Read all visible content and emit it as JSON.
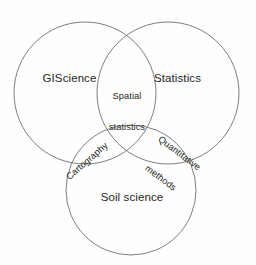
{
  "figure": {
    "type": "venn-diagram",
    "set_count": 3,
    "background_color": "#fefefe",
    "stroke_color": "#6e6e6e",
    "text_color": "#262626"
  },
  "chart_data": {
    "type": "venn",
    "title": "",
    "sets": [
      {
        "id": "giscience",
        "label": "GIScience",
        "cx": 85,
        "cy": 93,
        "r": 71
      },
      {
        "id": "statistics",
        "label": "Statistics",
        "cx": 168,
        "cy": 93,
        "r": 71
      },
      {
        "id": "soil_science",
        "label": "Soil science",
        "cx": 131,
        "cy": 190,
        "r": 65
      }
    ],
    "intersections": [
      {
        "id": "spatial_statistics",
        "label": "Spatial\nstatistics",
        "line1": "Spatial",
        "line2": "statistics",
        "members": [
          "giscience",
          "statistics"
        ],
        "rotation_deg": 0
      },
      {
        "id": "cartography",
        "label": "Cartography",
        "line1": "Cartography",
        "line2": "",
        "members": [
          "giscience",
          "soil_science"
        ],
        "rotation_deg": -41
      },
      {
        "id": "quantitative_methods",
        "label": "Quantitative\nmethods",
        "line1": "Quantitative",
        "line2": "methods",
        "members": [
          "statistics",
          "soil_science"
        ],
        "rotation_deg": 37
      }
    ],
    "center_intersection": {
      "id": "triple_overlap",
      "label": "",
      "members": [
        "giscience",
        "statistics",
        "soil_science"
      ]
    }
  }
}
